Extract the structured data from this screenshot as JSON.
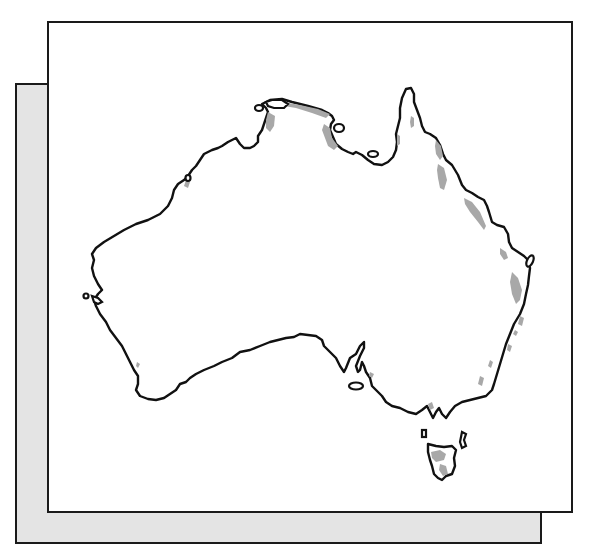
{
  "figure": {
    "style": "outline map with shaded regions",
    "colors": {
      "background": "#ffffff",
      "outline": "#111111",
      "shaded_region": "#a8a8a8",
      "shadow_panel": "#e4e4e4",
      "frame_border": "#1a1a1a"
    },
    "shaded_regions": [
      "Top End (Northern Territory coast)",
      "Gulf of Carpentaria coast",
      "Cape York Peninsula",
      "Queensland east coast",
      "New South Wales east coast",
      "Victoria highlands",
      "Tasmania west and south"
    ],
    "islands": [
      "Melville Island",
      "Groote Eylandt",
      "Mornington Island",
      "Fraser Island",
      "Kangaroo Island",
      "King Island",
      "Flinders Island",
      "Dirk Hartog Island",
      "Tasmania"
    ]
  }
}
